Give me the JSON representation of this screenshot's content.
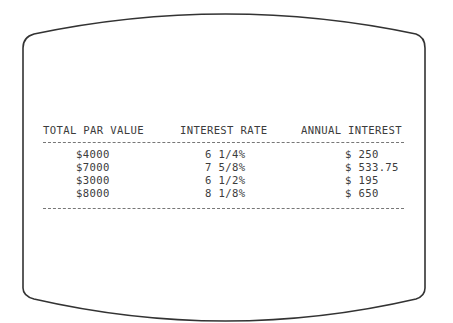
{
  "table": {
    "headers": [
      "TOTAL PAR VALUE",
      "INTEREST RATE",
      "ANNUAL INTEREST"
    ],
    "rows": [
      {
        "par_value": "$4000",
        "rate": "6 1/4%",
        "annual_interest": "$ 250"
      },
      {
        "par_value": "$7000",
        "rate": "7 5/8%",
        "annual_interest": "$ 533.75"
      },
      {
        "par_value": "$3000",
        "rate": "6 1/2%",
        "annual_interest": "$ 195"
      },
      {
        "par_value": "$8000",
        "rate": "8 1/8%",
        "annual_interest": "$ 650"
      }
    ]
  },
  "colors": {
    "frame": "#333333",
    "text": "#3c3c3c",
    "background": "#ffffff"
  }
}
